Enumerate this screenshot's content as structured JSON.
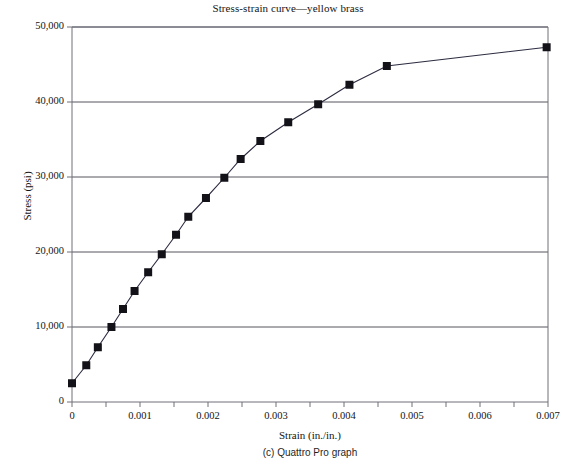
{
  "chart_data": {
    "type": "line",
    "title": "Stress-strain curve—yellow brass",
    "xlabel": "Strain (in./in.)",
    "ylabel": "Stress (psi)",
    "xlim": [
      0,
      0.007
    ],
    "ylim": [
      0,
      50000
    ],
    "grid": "horizontal",
    "legend": "none",
    "marker": "filled-square",
    "xticks": [
      0,
      0.001,
      0.002,
      0.003,
      0.004,
      0.005,
      0.006,
      0.007
    ],
    "xtick_labels": [
      "0",
      "0.001",
      "0.002",
      "0.003",
      "0.004",
      "0.005",
      "0.006",
      "0.007"
    ],
    "xminor_step": 0.0005,
    "yticks": [
      0,
      10000,
      20000,
      30000,
      40000,
      50000
    ],
    "ytick_labels": [
      "0",
      "10,000",
      "20,000",
      "30,000",
      "40,000",
      "50,000"
    ],
    "series": [
      {
        "name": "yellow brass",
        "x": [
          0.0,
          0.00021,
          0.00038,
          0.00058,
          0.00075,
          0.00092,
          0.00112,
          0.00132,
          0.00153,
          0.00171,
          0.00197,
          0.00224,
          0.00248,
          0.00277,
          0.00318,
          0.00362,
          0.00408,
          0.00463,
          0.00698
        ],
        "y": [
          2500,
          4900,
          7300,
          10000,
          12400,
          14800,
          17300,
          19700,
          22300,
          24700,
          27200,
          29900,
          32400,
          34800,
          37300,
          39700,
          42300,
          44800,
          47300
        ]
      }
    ]
  },
  "figure": {
    "caption": "(c) Quattro Pro graph"
  },
  "colors": {
    "line": "#2b2b40",
    "marker": "#121218",
    "frame": "#6e6e78",
    "grid": "#54545e",
    "text": "#141414"
  }
}
